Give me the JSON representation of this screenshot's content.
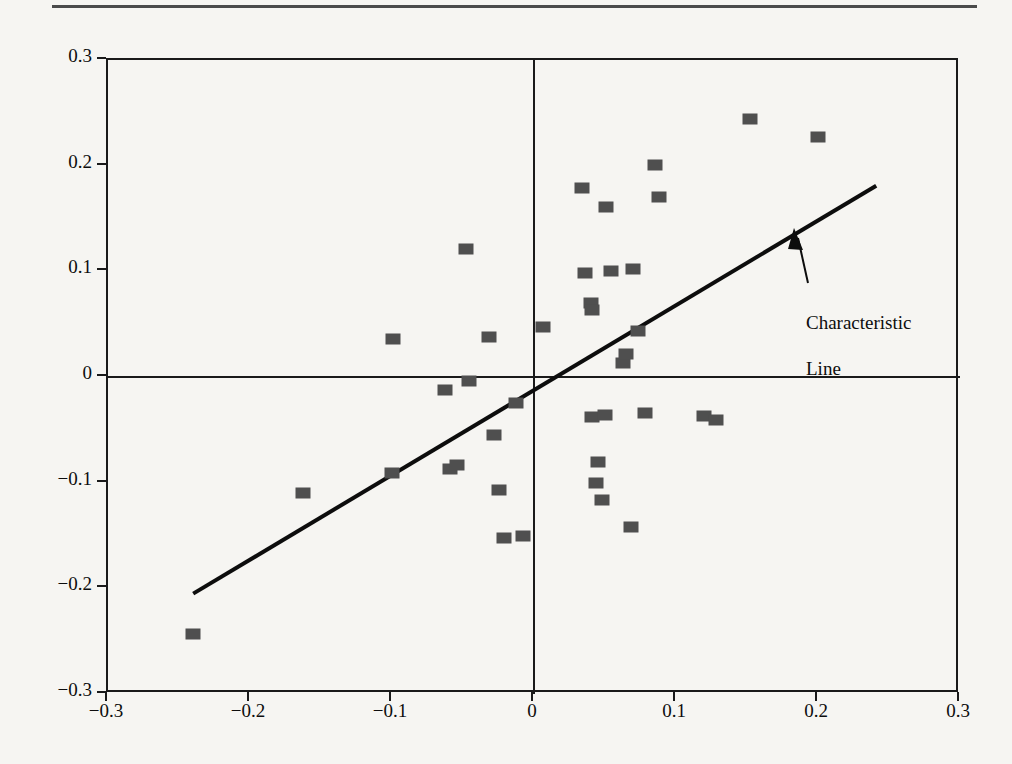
{
  "figure": {
    "has_top_rule": true,
    "background_color": "#f6f5f2",
    "ink_color": "#1a1a1a",
    "marker_color": "#4f4f4f"
  },
  "annotation": {
    "label": "Characteristic\nLine",
    "line1": "Characteristic",
    "line2": "Line"
  },
  "chart_data": {
    "type": "scatter",
    "title": "",
    "xlabel": "",
    "ylabel": "",
    "xlim": [
      -0.3,
      0.3
    ],
    "ylim": [
      -0.3,
      0.3
    ],
    "grid": false,
    "legend": "none",
    "xticks": [
      -0.3,
      -0.2,
      -0.1,
      0,
      0.1,
      0.2,
      0.3
    ],
    "xtick_labels": [
      "-0.3",
      "-0.2",
      "-0.1",
      "0",
      "0.1",
      "0.2",
      "0.3"
    ],
    "yticks": [
      -0.3,
      -0.2,
      -0.1,
      0,
      0.1,
      0.2,
      0.3
    ],
    "ytick_labels": [
      "-0.3",
      "-0.2",
      "-0.1",
      "0",
      "0.1",
      "0.2",
      "0.3"
    ],
    "zero_axes": true,
    "annotations": [
      {
        "text": "Characteristic Line",
        "arrow_tip": [
          0.186,
          0.135
        ],
        "text_anchor": [
          0.196,
          0.085
        ]
      }
    ],
    "series": [
      {
        "name": "Characteristic Line",
        "type": "line",
        "x": [
          -0.24,
          0.241
        ],
        "y": [
          -0.205,
          0.181
        ],
        "slope": 0.802,
        "intercept": -0.0125
      },
      {
        "name": "Returns",
        "type": "scatter",
        "marker": "square",
        "points": [
          [
            -0.24,
            -0.243
          ],
          [
            -0.163,
            -0.11
          ],
          [
            -0.1,
            -0.091
          ],
          [
            -0.099,
            0.036
          ],
          [
            -0.063,
            -0.012
          ],
          [
            -0.059,
            -0.087
          ],
          [
            -0.054,
            -0.083
          ],
          [
            -0.048,
            0.121
          ],
          [
            -0.046,
            -0.004
          ],
          [
            -0.032,
            0.038
          ],
          [
            -0.028,
            -0.055
          ],
          [
            -0.025,
            -0.107
          ],
          [
            -0.021,
            -0.152
          ],
          [
            -0.013,
            -0.025
          ],
          [
            -0.008,
            -0.15
          ],
          [
            0.006,
            0.047
          ],
          [
            0.034,
            0.179
          ],
          [
            0.036,
            0.098
          ],
          [
            0.04,
            0.07
          ],
          [
            0.041,
            0.063
          ],
          [
            0.041,
            -0.038
          ],
          [
            0.044,
            -0.1
          ],
          [
            0.045,
            -0.08
          ],
          [
            0.048,
            -0.116
          ],
          [
            0.05,
            -0.036
          ],
          [
            0.051,
            0.161
          ],
          [
            0.054,
            0.1
          ],
          [
            0.063,
            0.013
          ],
          [
            0.065,
            0.022
          ],
          [
            0.068,
            -0.142
          ],
          [
            0.07,
            0.102
          ],
          [
            0.073,
            0.044
          ],
          [
            0.078,
            -0.034
          ],
          [
            0.085,
            0.201
          ],
          [
            0.088,
            0.17
          ],
          [
            0.12,
            -0.037
          ],
          [
            0.128,
            -0.041
          ],
          [
            0.152,
            0.244
          ],
          [
            0.2,
            0.227
          ]
        ]
      }
    ]
  }
}
